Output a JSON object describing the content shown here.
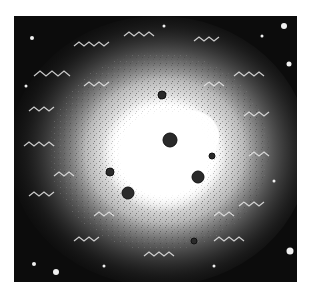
{
  "image": {
    "subject": "nebula-illustration",
    "style": "black-and-white engraving",
    "background_color": "#ffffff",
    "field_color": "#0c0c0c",
    "glow_color": "#ffffff",
    "frame": {
      "x": 14,
      "y": 16,
      "width": 283,
      "height": 266
    },
    "core": {
      "cx": 160,
      "cy": 148,
      "rx": 62,
      "ry": 58
    },
    "bright_stars": [
      {
        "x": 170,
        "y": 140,
        "r": 7
      },
      {
        "x": 198,
        "y": 177,
        "r": 6
      },
      {
        "x": 128,
        "y": 193,
        "r": 6
      },
      {
        "x": 110,
        "y": 172,
        "r": 4
      },
      {
        "x": 162,
        "y": 95,
        "r": 4
      }
    ]
  }
}
